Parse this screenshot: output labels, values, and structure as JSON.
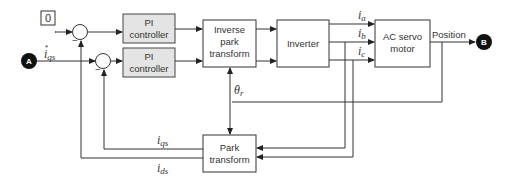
{
  "diagram": {
    "type": "block-diagram",
    "title": "",
    "blocks": {
      "ref_zero": "0",
      "pi1": {
        "line1": "PI",
        "line2": "controller"
      },
      "pi2": {
        "line1": "PI",
        "line2": "controller"
      },
      "inverse_park": {
        "line1": "Inverse",
        "line2": "park",
        "line3": "transform"
      },
      "inverter": "Inverter",
      "motor": {
        "line1": "AC servo",
        "line2": "motor"
      },
      "park": {
        "line1": "Park",
        "line2": "transform"
      }
    },
    "connectors": {
      "A": "A",
      "B": "B"
    },
    "signals": {
      "iqs_ref": {
        "base": "i",
        "sub": "qs",
        "sup": "*"
      },
      "ia": {
        "base": "i",
        "sub": "a"
      },
      "ib": {
        "base": "i",
        "sub": "b"
      },
      "ic": {
        "base": "i",
        "sub": "c"
      },
      "theta": {
        "base": "θ",
        "sub": "r"
      },
      "iqs": {
        "base": "i",
        "sub": "qs"
      },
      "ids": {
        "base": "i",
        "sub": "ds"
      },
      "position": "Position"
    },
    "summer_signs": {
      "s1_minus": "−",
      "s2_minus": "−"
    }
  }
}
